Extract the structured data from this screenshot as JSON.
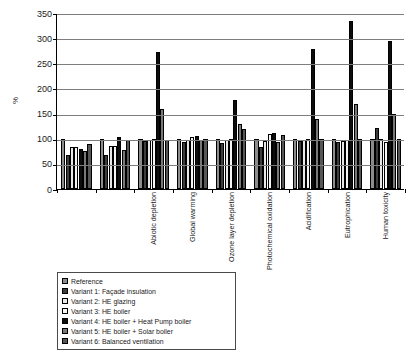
{
  "chart_data": {
    "type": "bar",
    "title": "",
    "subtitle": "",
    "xlabel": "",
    "ylabel": "%",
    "ylim": [
      0,
      350
    ],
    "yticks": [
      0,
      50,
      100,
      150,
      200,
      250,
      300,
      350
    ],
    "grid": true,
    "legend_position": "below-left",
    "categories": [
      "Abiotic depletion",
      "Global warming",
      "Ozone layer depletion",
      "Photochemical oxidation",
      "Acidification",
      "Eutrophication",
      "Human toxicity",
      "Fresh water aquatic toxicity",
      "Terrestrial ecotoxicity"
    ],
    "series": [
      {
        "name": "Reference",
        "color": "#8c8c8c",
        "values": [
          100,
          100,
          100,
          100,
          100,
          100,
          100,
          100,
          100
        ]
      },
      {
        "name": "Variant 1: Façade insulation",
        "color": "#3d3d3d",
        "values": [
          67,
          68,
          95,
          93,
          92,
          83,
          96,
          93,
          122
        ]
      },
      {
        "name": "Variant 2: HE glazing",
        "color": "#e8e8e8",
        "values": [
          83,
          85,
          98,
          97,
          98,
          95,
          98,
          96,
          100
        ]
      },
      {
        "name": "Variant 3: HE boiler",
        "color": "#f5f5f5",
        "values": [
          84,
          85,
          99,
          103,
          100,
          110,
          100,
          98,
          93
        ]
      },
      {
        "name": "Variant 4: HE boiler + Heat Pump boiler",
        "color": "#0d0d0d",
        "values": [
          80,
          104,
          272,
          105,
          178,
          112,
          279,
          335,
          295
        ]
      },
      {
        "name": "Variant 5: HE boiler + Solar boiler",
        "color": "#787878",
        "values": [
          76,
          78,
          160,
          98,
          130,
          94,
          140,
          170,
          150
        ]
      },
      {
        "name": "Variant 6: Balanced ventilation",
        "color": "#565656",
        "values": [
          90,
          97,
          98,
          100,
          120,
          107,
          100,
          99,
          100
        ]
      }
    ]
  },
  "legend": {
    "items": [
      "Reference",
      "Variant 1: Façade insulation",
      "Variant 2: HE glazing",
      "Variant 3: HE boiler",
      "Variant 4: HE boiler + Heat Pump boiler",
      "Variant 5: HE boiler + Solar boiler",
      "Variant 6: Balanced ventilation"
    ]
  }
}
